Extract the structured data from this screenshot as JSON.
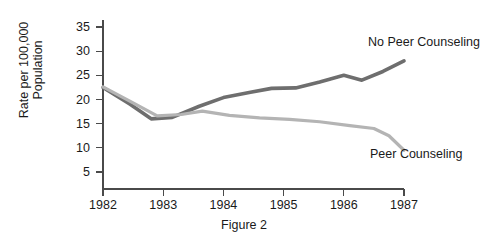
{
  "figure": {
    "caption": "Figure 2"
  },
  "chart_data": {
    "type": "line",
    "title": "",
    "xlabel": "",
    "ylabel": "Rate per 100,000 Population",
    "ylabel_line1": "Rate per 100,000",
    "ylabel_line2": "Population",
    "xlim": [
      1982,
      1987
    ],
    "ylim": [
      0,
      37
    ],
    "yticks": [
      5,
      10,
      15,
      20,
      25,
      30,
      35
    ],
    "xticks": [
      1982,
      1983,
      1984,
      1985,
      1986,
      1987
    ],
    "xtick_labels": [
      "1982",
      "1983",
      "1984",
      "1985",
      "1986",
      "1987"
    ],
    "ytick_labels": [
      "5",
      "10",
      "15",
      "20",
      "25",
      "30",
      "35"
    ],
    "grid": false,
    "legend_position": "inline-annotations",
    "colors": {
      "no_peer_counseling": "#6e6e6e",
      "peer_counseling": "#b4b4b4",
      "axis": "#4a4a4a",
      "text": "#1a1a1a",
      "background": "#ffffff"
    },
    "series": [
      {
        "name": "No Peer Counseling",
        "color": "#6e6e6e",
        "label_text": "No Peer Counseling",
        "x": [
          1982.0,
          1982.45,
          1982.8,
          1983.15,
          1983.6,
          1984.0,
          1984.45,
          1984.8,
          1985.2,
          1985.6,
          1986.0,
          1986.3,
          1986.65,
          1987.0
        ],
        "values": [
          22.5,
          19.0,
          16.0,
          16.3,
          18.6,
          20.4,
          21.5,
          22.3,
          22.4,
          23.6,
          25.0,
          24.0,
          25.8,
          28.0
        ]
      },
      {
        "name": "Peer Counseling",
        "color": "#b4b4b4",
        "label_text": "Peer Counseling",
        "x": [
          1982.0,
          1982.5,
          1982.9,
          1983.3,
          1983.65,
          1984.1,
          1984.6,
          1985.1,
          1985.6,
          1986.1,
          1986.5,
          1986.75,
          1987.0
        ],
        "values": [
          22.6,
          19.3,
          16.6,
          16.9,
          17.6,
          16.7,
          16.2,
          15.9,
          15.4,
          14.6,
          14.0,
          12.5,
          9.5
        ]
      }
    ]
  }
}
